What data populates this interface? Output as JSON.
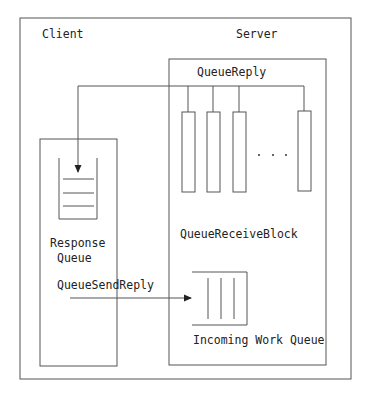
{
  "diagram": {
    "colors": {
      "stroke": "#555555",
      "text": "#222222",
      "background": "#ffffff"
    },
    "regions": {
      "client": {
        "label": "Client"
      },
      "server": {
        "label": "Server"
      }
    },
    "response_queue": {
      "label_line1": "Response",
      "label_line2": "Queue"
    },
    "queue_reply": {
      "label": "QueueReply"
    },
    "queue_receive_block": {
      "label": "QueueReceiveBlock",
      "bars": 4,
      "ellipsis": ". . ."
    },
    "queue_send_reply": {
      "label": "QueueSendReply"
    },
    "incoming_work_queue": {
      "label": "Incoming Work Queue"
    }
  }
}
